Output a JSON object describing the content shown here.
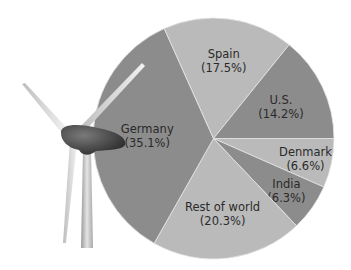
{
  "chart_data": {
    "type": "pie",
    "title": "",
    "slices": [
      {
        "label": "Denmark",
        "value": 6.6,
        "display": "(6.6%)",
        "shade": "light"
      },
      {
        "label": "India",
        "value": 6.3,
        "display": "(6.3%)",
        "shade": "dark"
      },
      {
        "label": "Rest of world",
        "value": 20.3,
        "display": "(20.3%)",
        "shade": "light"
      },
      {
        "label": "Germany",
        "value": 35.1,
        "display": "(35.1%)",
        "shade": "dark"
      },
      {
        "label": "Spain",
        "value": 17.5,
        "display": "(17.5%)",
        "shade": "light"
      },
      {
        "label": "U.S.",
        "value": 14.2,
        "display": "(14.2%)",
        "shade": "dark"
      }
    ],
    "start_angle_deg": 0,
    "direction": "clockwise",
    "legend": "none",
    "colors": {
      "dark": "#8c8c8c",
      "light": "#bababa",
      "border": "#e6e6e6",
      "text": "#2a2a2a"
    },
    "decoration": "wind-turbine"
  }
}
